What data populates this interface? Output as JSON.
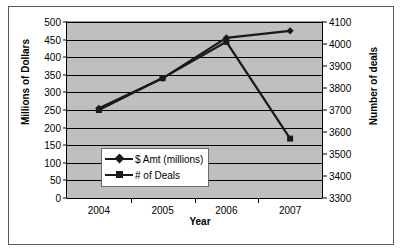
{
  "chart_data": {
    "type": "line",
    "title": "",
    "xlabel": "Year",
    "ylabel": "Millions of Dollars",
    "y2label": "Number of deals",
    "categories": [
      "2004",
      "2005",
      "2006",
      "2007"
    ],
    "series": [
      {
        "name": "$ Amt (millions)",
        "axis": "left",
        "marker": "diamond",
        "values": [
          255,
          340,
          455,
          475
        ]
      },
      {
        "name": "# of Deals",
        "axis": "right",
        "marker": "square",
        "values": [
          3700,
          3845,
          4010,
          3570
        ]
      }
    ],
    "ylim": [
      0,
      500
    ],
    "ytick_step": 50,
    "yticks": [
      "0",
      "50",
      "100",
      "150",
      "200",
      "250",
      "300",
      "350",
      "400",
      "450",
      "500"
    ],
    "y2lim": [
      3300,
      4100
    ],
    "y2tick_step": 100,
    "y2ticks": [
      "3300",
      "3400",
      "3500",
      "3600",
      "3700",
      "3800",
      "3900",
      "4000",
      "4100"
    ],
    "grid": true,
    "legend_position": "inside-lower-left",
    "plot_background": "#bfbfbf",
    "line_color": "#1a1a1a",
    "grid_color": "#000000"
  }
}
